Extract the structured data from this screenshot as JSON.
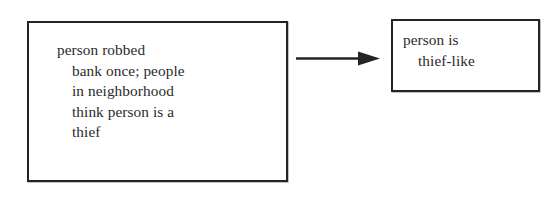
{
  "diagram": {
    "type": "flow-arrow-diagram",
    "background_color": "#ffffff",
    "ink_color": "#2b2b2b",
    "border_color": "#242424",
    "nodes": [
      {
        "id": "antecedent",
        "lines": [
          "person robbed",
          "bank once; people",
          "in neighborhood",
          "think person is a",
          "thief"
        ],
        "indent_style": "hanging"
      },
      {
        "id": "consequent",
        "lines": [
          "person is",
          "thief-like"
        ],
        "indent_style": "hanging"
      }
    ],
    "edges": [
      {
        "id": "antecedent-to-consequent",
        "from": "antecedent",
        "to": "consequent",
        "style": "solid-line-filled-arrowhead",
        "direction": "right"
      }
    ]
  },
  "antecedent": {
    "line1": "person robbed",
    "line2": "bank once; people",
    "line3": "in neighborhood",
    "line4": "think person is a",
    "line5": "thief"
  },
  "consequent": {
    "line1": "person is",
    "line2": "thief-like"
  }
}
